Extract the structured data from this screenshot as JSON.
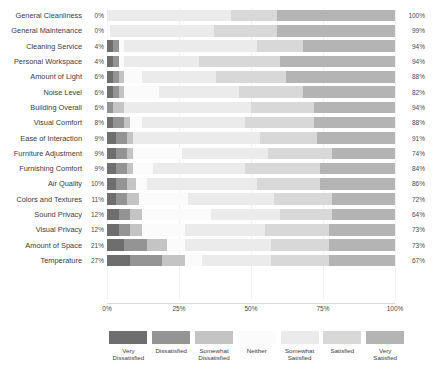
{
  "chart_data": {
    "type": "bar",
    "subtype": "diverging-stacked-likert",
    "title": "",
    "xlabel": "",
    "ylabel": "",
    "xlim": [
      0,
      100
    ],
    "xticks": [
      "0%",
      "25%",
      "50%",
      "75%",
      "100%"
    ],
    "xtick_values": [
      0,
      25,
      50,
      75,
      100
    ],
    "grid": true,
    "legend_position": "bottom",
    "legend": [
      {
        "label": "Very\nDissatisfied",
        "color": "#6e6e6e"
      },
      {
        "label": "Dissatisfied",
        "color": "#949494"
      },
      {
        "label": "Somewhat\nDissatisfied",
        "color": "#c4c4c4"
      },
      {
        "label": "Neither",
        "color": "#fbfbfb"
      },
      {
        "label": "Somewhat\nSatisfied",
        "color": "#ebebeb"
      },
      {
        "label": "Satisfied",
        "color": "#d8d8d8"
      },
      {
        "label": "Very\nSatisfied",
        "color": "#b4b4b4"
      }
    ],
    "categories": [
      "Very Dissatisfied",
      "Dissatisfied",
      "Somewhat Dissatisfied",
      "Neither",
      "Somewhat Satisfied",
      "Satisfied",
      "Very Satisfied"
    ],
    "rows": [
      {
        "label": "General Cleanliness",
        "left_pct": "0%",
        "right_pct": "100%",
        "values": [
          0,
          0,
          0,
          0,
          43,
          16,
          41
        ]
      },
      {
        "label": "General Maintenance",
        "left_pct": "0%",
        "right_pct": "99%",
        "values": [
          0,
          0,
          0,
          1,
          36,
          22,
          41
        ]
      },
      {
        "label": "Cleaning Service",
        "left_pct": "4%",
        "right_pct": "94%",
        "values": [
          2,
          2,
          0,
          2,
          46,
          16,
          32
        ]
      },
      {
        "label": "Personal Workspace",
        "left_pct": "4%",
        "right_pct": "94%",
        "values": [
          2,
          2,
          0,
          2,
          26,
          28,
          40
        ]
      },
      {
        "label": "Amount of Light",
        "left_pct": "6%",
        "right_pct": "88%",
        "values": [
          2,
          2,
          2,
          6,
          26,
          24,
          38
        ]
      },
      {
        "label": "Noise Level",
        "left_pct": "6%",
        "right_pct": "82%",
        "values": [
          2,
          2,
          2,
          12,
          28,
          22,
          32
        ]
      },
      {
        "label": "Building Overall",
        "left_pct": "6%",
        "right_pct": "94%",
        "values": [
          0,
          2,
          4,
          0,
          44,
          22,
          28
        ]
      },
      {
        "label": "Visual Comfort",
        "left_pct": "8%",
        "right_pct": "88%",
        "values": [
          2,
          4,
          2,
          4,
          36,
          24,
          28
        ]
      },
      {
        "label": "Ease of Interaction",
        "left_pct": "9%",
        "right_pct": "91%",
        "values": [
          3,
          4,
          2,
          0,
          44,
          20,
          27
        ]
      },
      {
        "label": "Furniture Adjustment",
        "left_pct": "9%",
        "right_pct": "74%",
        "values": [
          3,
          4,
          2,
          17,
          30,
          22,
          22
        ]
      },
      {
        "label": "Furnishing Comfort",
        "left_pct": "9%",
        "right_pct": "84%",
        "values": [
          3,
          4,
          2,
          7,
          32,
          26,
          26
        ]
      },
      {
        "label": "Air Quality",
        "left_pct": "10%",
        "right_pct": "86%",
        "values": [
          3,
          4,
          3,
          4,
          38,
          22,
          26
        ]
      },
      {
        "label": "Colors and Textures",
        "left_pct": "11%",
        "right_pct": "72%",
        "values": [
          3,
          4,
          4,
          17,
          30,
          20,
          22
        ]
      },
      {
        "label": "Sound Privacy",
        "left_pct": "12%",
        "right_pct": "64%",
        "values": [
          4,
          4,
          4,
          24,
          24,
          18,
          22
        ]
      },
      {
        "label": "Visual Privacy",
        "left_pct": "12%",
        "right_pct": "73%",
        "values": [
          4,
          4,
          4,
          15,
          28,
          22,
          23
        ]
      },
      {
        "label": "Amount of Space",
        "left_pct": "21%",
        "right_pct": "73%",
        "values": [
          6,
          8,
          7,
          6,
          30,
          20,
          23
        ]
      },
      {
        "label": "Temperature",
        "left_pct": "27%",
        "right_pct": "67%",
        "values": [
          8,
          11,
          8,
          6,
          24,
          20,
          23
        ]
      }
    ]
  }
}
